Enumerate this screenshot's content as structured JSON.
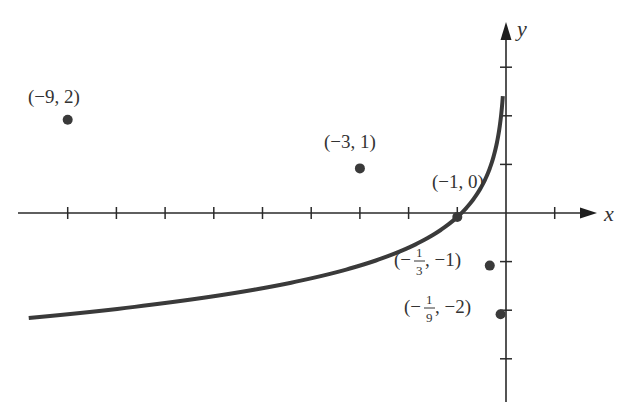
{
  "chart_data": {
    "type": "line",
    "title": "",
    "function": "y = -log_3(-x)",
    "xlabel": "x",
    "ylabel": "y",
    "xlim": [
      -9.8,
      1.9
    ],
    "ylim": [
      -3.9,
      3.9
    ],
    "grid": false,
    "legend": null,
    "x_ticks": [
      -9,
      -8,
      -7,
      -6,
      -5,
      -4,
      -3,
      -2,
      -1,
      0,
      1
    ],
    "y_ticks": [
      -3,
      -2,
      -1,
      1,
      2,
      3
    ],
    "tick_labels_shown": false,
    "series": [
      {
        "name": "curve",
        "color": "#3a3a3a",
        "x": [
          -9.8,
          -9,
          -8,
          -7,
          -6,
          -5,
          -4,
          -3,
          -2,
          -1.5,
          -1,
          -0.75,
          -0.5,
          -0.333,
          -0.25,
          -0.18,
          -0.111,
          -0.08
        ],
        "y": [
          2.08,
          2,
          1.89,
          1.77,
          1.63,
          1.46,
          1.26,
          1,
          0.63,
          0.37,
          0,
          -0.26,
          -0.63,
          -1,
          -1.26,
          -1.56,
          -2,
          -2.3
        ]
      }
    ],
    "points": [
      {
        "x": -9,
        "y": 2,
        "label": "(−9, 2)"
      },
      {
        "x": -3,
        "y": 1,
        "label": "(−3, 1)"
      },
      {
        "x": -1,
        "y": 0,
        "label": "(−1, 0)"
      },
      {
        "x": -0.3333,
        "y": -1,
        "label_pre": "(−",
        "label_num": "1",
        "label_den": "3",
        "label_post": ", −1)"
      },
      {
        "x": -0.1111,
        "y": -2,
        "label_pre": "(−",
        "label_num": "1",
        "label_den": "9",
        "label_post": ", −2)"
      }
    ],
    "annotations": [
      "(−9, 2)",
      "(−3, 1)",
      "(−1, 0)",
      "(−1/3, −1)",
      "(−1/9, −2)"
    ]
  },
  "labels": {
    "x_axis": "x",
    "y_axis": "y",
    "p1": "(−9, 2)",
    "p2": "(−3, 1)",
    "p3": "(−1, 0)",
    "p4_pre": "(−",
    "p4_num": "1",
    "p4_den": "3",
    "p4_post": ", −1)",
    "p5_pre": "(−",
    "p5_num": "1",
    "p5_den": "9",
    "p5_post": ", −2)"
  },
  "colors": {
    "curve": "#3a3a3a",
    "axis": "#2a2a2a",
    "text": "#333333",
    "background": "#ffffff"
  }
}
